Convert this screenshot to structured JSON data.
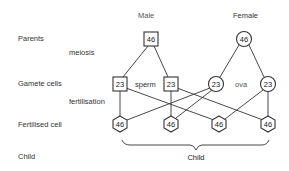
{
  "headers": {
    "male": "Male",
    "female": "Female"
  },
  "row_labels": {
    "parents": "Parents",
    "meiosis": "meiosis",
    "gamete_cells": "Gamete cells",
    "fertilisation": "fertilisation",
    "fertilised_cell": "Fertilised cell",
    "child": "Child"
  },
  "gamete_labels": {
    "sperm": "sperm",
    "ova": "ova"
  },
  "nodes": {
    "male_parent": "46",
    "female_parent": "46",
    "sperm_1": "23",
    "sperm_2": "23",
    "ovum_1": "23",
    "ovum_2": "23",
    "zygote_1": "46",
    "zygote_2": "46",
    "zygote_3": "46",
    "zygote_4": "46"
  },
  "brace_label": "Child",
  "colors": {
    "line": "#333333",
    "text": "#333333",
    "background": "#ffffff"
  }
}
